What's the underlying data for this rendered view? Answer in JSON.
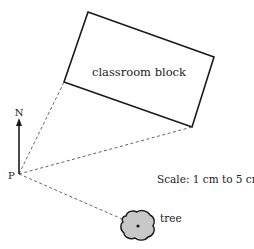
{
  "diagram": {
    "type": "scale-drawing-plan",
    "building": {
      "label": "classroom block",
      "corners": [
        [
          88,
          12
        ],
        [
          214,
          57
        ],
        [
          192,
          127
        ],
        [
          64,
          82
        ]
      ]
    },
    "point": {
      "label": "P",
      "position": [
        19,
        174
      ]
    },
    "north_arrow": {
      "label": "N",
      "from": [
        19,
        174
      ],
      "to": [
        19,
        120
      ]
    },
    "sight_lines": [
      {
        "from": "P",
        "to": "classroom block left corner"
      },
      {
        "from": "P",
        "to": "classroom block bottom corner"
      },
      {
        "from": "P",
        "to": "tree"
      }
    ],
    "tree": {
      "label": "tree",
      "center": [
        138,
        226
      ]
    },
    "scale": {
      "label": "Scale: 1 cm to 5 cm"
    },
    "colors": {
      "line": "#1a1a1a",
      "tree_fill": "#c8c8c8",
      "dash": "#555555"
    }
  }
}
